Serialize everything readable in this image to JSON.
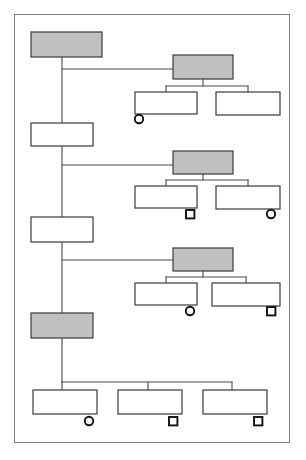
{
  "figure": {
    "type": "hierarchy-tree-diagram",
    "orientation": "vertical-spine-with-right-branching-clusters",
    "title": "",
    "caption": "",
    "colors": {
      "page_background": "#ffffff",
      "frame_border": "#808080",
      "node_outline": "#3a3a3a",
      "node_fill_plain": "#ffffff",
      "node_fill_shaded": "#c0c0c0",
      "connector": "#4a4a4a",
      "marker_outline": "#111111",
      "marker_fill": "#ffffff"
    },
    "frame": {
      "x": 14,
      "y": 14,
      "width": 276,
      "height": 429
    },
    "legend_shapes": [
      "circle",
      "square"
    ]
  },
  "nodes": {
    "spine": [
      {
        "id": "spine-1",
        "label": "",
        "fill": "shaded",
        "x": 31,
        "y": 32,
        "width": 71,
        "height": 25
      },
      {
        "id": "spine-2",
        "label": "",
        "fill": "plain",
        "x": 31,
        "y": 123,
        "width": 62,
        "height": 23
      },
      {
        "id": "spine-3",
        "label": "",
        "fill": "plain",
        "x": 31,
        "y": 217,
        "width": 62,
        "height": 25
      },
      {
        "id": "spine-4",
        "label": "",
        "fill": "shaded",
        "x": 31,
        "y": 313,
        "width": 62,
        "height": 25
      }
    ],
    "clusters": [
      {
        "id": "cluster-1",
        "head": {
          "id": "c1-head",
          "label": "",
          "fill": "shaded",
          "x": 173,
          "y": 55,
          "width": 60,
          "height": 24
        },
        "children": [
          {
            "id": "c1-child-1",
            "label": "",
            "fill": "plain",
            "x": 135,
            "y": 92,
            "width": 62,
            "height": 22,
            "marker": "circle",
            "marker_x": 139,
            "marker_y": 119
          },
          {
            "id": "c1-child-2",
            "label": "",
            "fill": "plain",
            "x": 216,
            "y": 92,
            "width": 64,
            "height": 23,
            "marker": "none"
          }
        ]
      },
      {
        "id": "cluster-2",
        "head": {
          "id": "c2-head",
          "label": "",
          "fill": "shaded",
          "x": 173,
          "y": 151,
          "width": 60,
          "height": 23
        },
        "children": [
          {
            "id": "c2-child-1",
            "label": "",
            "fill": "plain",
            "x": 135,
            "y": 186,
            "width": 62,
            "height": 22,
            "marker": "square",
            "marker_x": 190,
            "marker_y": 214
          },
          {
            "id": "c2-child-2",
            "label": "",
            "fill": "plain",
            "x": 216,
            "y": 186,
            "width": 64,
            "height": 23,
            "marker": "circle",
            "marker_x": 271,
            "marker_y": 214
          }
        ]
      },
      {
        "id": "cluster-3",
        "head": {
          "id": "c3-head",
          "label": "",
          "fill": "shaded",
          "x": 173,
          "y": 248,
          "width": 60,
          "height": 23
        },
        "children": [
          {
            "id": "c3-child-1",
            "label": "",
            "fill": "plain",
            "x": 135,
            "y": 283,
            "width": 62,
            "height": 22,
            "marker": "circle",
            "marker_x": 190,
            "marker_y": 311
          },
          {
            "id": "c3-child-2",
            "label": "",
            "fill": "plain",
            "x": 212,
            "y": 283,
            "width": 68,
            "height": 23,
            "marker": "square",
            "marker_x": 271,
            "marker_y": 311
          }
        ]
      }
    ],
    "bottom_row": [
      {
        "id": "bottom-1",
        "label": "",
        "fill": "plain",
        "x": 33,
        "y": 390,
        "width": 64,
        "height": 24,
        "marker": "circle",
        "marker_x": 89,
        "marker_y": 421
      },
      {
        "id": "bottom-2",
        "label": "",
        "fill": "plain",
        "x": 118,
        "y": 390,
        "width": 64,
        "height": 24,
        "marker": "square",
        "marker_x": 173,
        "marker_y": 421
      },
      {
        "id": "bottom-3",
        "label": "",
        "fill": "plain",
        "x": 203,
        "y": 390,
        "width": 64,
        "height": 24,
        "marker": "square",
        "marker_x": 258,
        "marker_y": 421
      }
    ]
  },
  "connectors": {
    "spine_x": 62,
    "spine_segments": [
      {
        "from": "spine-1",
        "to": "spine-2",
        "x": 62,
        "y1": 57,
        "y2": 123
      },
      {
        "from": "spine-2",
        "to": "spine-3",
        "x": 62,
        "y1": 146,
        "y2": 217
      },
      {
        "from": "spine-3",
        "to": "spine-4",
        "x": 62,
        "y1": 242,
        "y2": 313
      },
      {
        "from": "spine-4",
        "to": "bottom-bus",
        "x": 62,
        "y1": 338,
        "y2": 382
      }
    ],
    "branch_lines": [
      {
        "label": "spine-to-cluster-1",
        "x1": 62,
        "x2": 173,
        "y": 69
      },
      {
        "label": "spine-to-cluster-2",
        "x1": 62,
        "x2": 173,
        "y": 165
      },
      {
        "label": "spine-to-cluster-3",
        "x1": 62,
        "x2": 173,
        "y": 260
      }
    ],
    "bottom_bus": {
      "y": 382,
      "x1": 62,
      "x2": 232,
      "drops": [
        62,
        148,
        232
      ]
    }
  }
}
